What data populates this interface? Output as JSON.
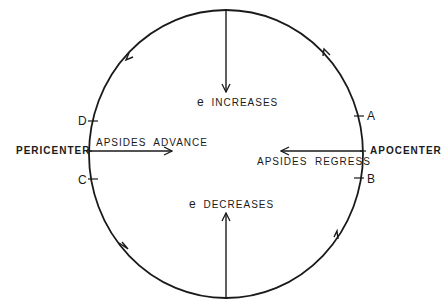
{
  "diagram": {
    "orbit": {
      "cx": 226,
      "cy": 154,
      "rx": 137,
      "ry": 144,
      "stroke": "#1a1a1a"
    },
    "labels": {
      "pericenter": "PERICENTER",
      "apocenter": "APOCENTER",
      "apsides_advance": "APSIDES  ADVANCE",
      "apsides_regress": "APSIDES  REGRESS",
      "e_increases_sym": "e",
      "e_increases": "INCREASES",
      "e_decreases_sym": "e",
      "e_decreases": "DECREASES",
      "point_a": "A",
      "point_b": "B",
      "point_c": "C",
      "point_d": "D"
    },
    "arrows": [
      {
        "name": "e-increases-arrow",
        "from": [
          226,
          10
        ],
        "to": [
          226,
          90
        ],
        "direction": "down"
      },
      {
        "name": "e-decreases-arrow",
        "from": [
          226,
          298
        ],
        "to": [
          226,
          215
        ],
        "direction": "up"
      },
      {
        "name": "apsides-advance-arrow",
        "from": [
          89,
          151
        ],
        "to": [
          170,
          151
        ],
        "direction": "right"
      },
      {
        "name": "apsides-regress-arrow",
        "from": [
          362,
          151
        ],
        "to": [
          283,
          151
        ],
        "direction": "left"
      }
    ],
    "orbit_direction": "counterclockwise"
  }
}
